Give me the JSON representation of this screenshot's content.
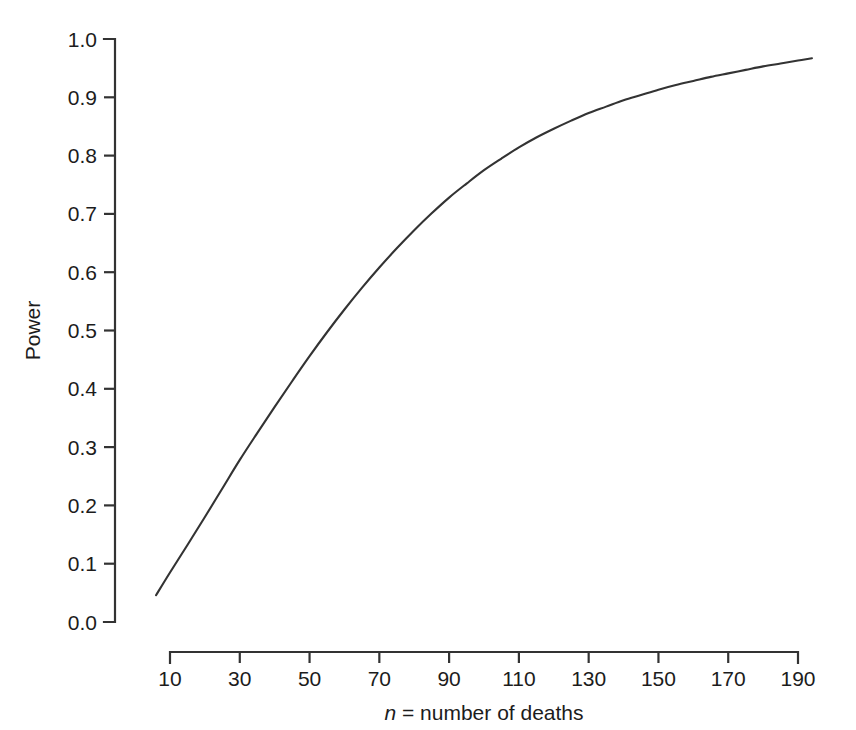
{
  "chart_data": {
    "type": "line",
    "title": "",
    "subtitle": "",
    "xlabel": "n = number of deaths",
    "xlabel_italic_part": "n",
    "xlabel_rest": " = number of deaths",
    "ylabel": "Power",
    "xlim": [
      4,
      196
    ],
    "ylim": [
      0.0,
      1.0
    ],
    "grid": false,
    "legend": null,
    "x_ticks": [
      10,
      30,
      50,
      70,
      90,
      110,
      130,
      150,
      170,
      190
    ],
    "x_tick_labels": [
      "10",
      "30",
      "50",
      "70",
      "90",
      "110",
      "130",
      "150",
      "170",
      "190"
    ],
    "y_ticks": [
      0.0,
      0.1,
      0.2,
      0.3,
      0.4,
      0.5,
      0.6,
      0.7,
      0.8,
      0.9,
      1.0
    ],
    "y_tick_labels": [
      "0.0",
      "0.1",
      "0.2",
      "0.3",
      "0.4",
      "0.5",
      "0.6",
      "0.7",
      "0.8",
      "0.9",
      "1.0"
    ],
    "series": [
      {
        "name": "Power curve",
        "color": "#333333",
        "x": [
          6,
          10,
          15,
          20,
          25,
          30,
          35,
          40,
          45,
          50,
          55,
          60,
          65,
          70,
          75,
          80,
          85,
          90,
          95,
          100,
          105,
          110,
          115,
          120,
          125,
          130,
          135,
          140,
          145,
          150,
          155,
          160,
          165,
          170,
          175,
          180,
          185,
          190,
          194
        ],
        "y": [
          0.046,
          0.085,
          0.132,
          0.18,
          0.229,
          0.278,
          0.324,
          0.369,
          0.413,
          0.456,
          0.497,
          0.536,
          0.573,
          0.608,
          0.641,
          0.672,
          0.701,
          0.728,
          0.752,
          0.775,
          0.795,
          0.814,
          0.831,
          0.846,
          0.86,
          0.873,
          0.884,
          0.895,
          0.904,
          0.913,
          0.921,
          0.928,
          0.935,
          0.941,
          0.947,
          0.953,
          0.958,
          0.963,
          0.967
        ]
      }
    ],
    "colors": {
      "curve": "#333333",
      "axis": "#333333",
      "text": "#1c1c1c",
      "background": "#ffffff"
    }
  },
  "axes_geometry": {
    "x_axis_left_px": 170,
    "x_axis_right_px": 798,
    "x_axis_y_px": 652,
    "y_axis_x_px": 115,
    "y_axis_top_px": 39,
    "y_axis_bottom_px": 622
  }
}
